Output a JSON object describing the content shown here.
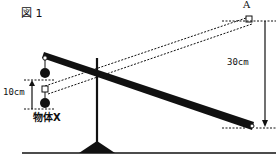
{
  "figure": {
    "title": "図 1",
    "point_label": "A",
    "dimension_right": "30cm",
    "dimension_left": "10cm",
    "object_label": "物体X"
  },
  "colors": {
    "stroke": "#111111",
    "background": "#ffffff"
  }
}
